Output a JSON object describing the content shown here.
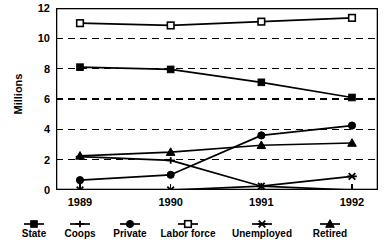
{
  "chart_data": {
    "type": "line",
    "title": "",
    "xlabel": "",
    "ylabel": "Millions",
    "categories": [
      "1989",
      "1990",
      "1991",
      "1992"
    ],
    "ylim": [
      0,
      12
    ],
    "yticks": [
      0,
      2,
      4,
      6,
      8,
      10,
      12
    ],
    "ytick_labels": [
      "0",
      "2",
      "4",
      "6",
      "8",
      "10",
      "12"
    ],
    "grid": "horizontal-dashed",
    "legend_position": "bottom",
    "series": [
      {
        "name": "State",
        "marker": "filled-square",
        "values": [
          8.1,
          7.95,
          7.1,
          6.1
        ]
      },
      {
        "name": "Coops",
        "marker": "plus",
        "values": [
          2.2,
          1.95,
          0.25,
          0.0
        ]
      },
      {
        "name": "Private",
        "marker": "filled-circle",
        "values": [
          0.65,
          1.0,
          3.6,
          4.25
        ]
      },
      {
        "name": "Labor force",
        "marker": "open-square",
        "values": [
          11.0,
          10.85,
          11.1,
          11.35
        ]
      },
      {
        "name": "Unemployed",
        "marker": "cross-bar",
        "values": [
          0.0,
          0.0,
          0.25,
          0.9
        ]
      },
      {
        "name": "Retired",
        "marker": "filled-triangle",
        "values": [
          2.25,
          2.5,
          2.95,
          3.1
        ]
      }
    ]
  },
  "colors": {
    "line": "#000000",
    "axis": "#000000",
    "grid": "#000000",
    "background": "#ffffff"
  }
}
